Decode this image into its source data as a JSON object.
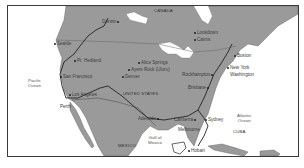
{
  "map": {
    "colors": {
      "land": "#9a9a9a",
      "water": "#ffffff",
      "border": "#3a3a3a",
      "route": "#2a2a2a",
      "lakes": "#ffffff"
    },
    "countries": [
      {
        "name": "CANADA",
        "x": 146,
        "y": 3
      },
      {
        "name": "UNITED STATES",
        "x": 115,
        "y": 86
      },
      {
        "name": "MEXICO",
        "x": 110,
        "y": 138
      },
      {
        "name": "CUBA",
        "x": 225,
        "y": 124
      }
    ],
    "water_bodies": [
      {
        "name": "Pacific\nOcean",
        "x": 26,
        "y": 70
      },
      {
        "name": "Gulf of\nMexico",
        "x": 140,
        "y": 129
      },
      {
        "name": "Atlantic\nOcean",
        "x": 227,
        "y": 107
      }
    ],
    "cities": [
      {
        "name": "Darwin",
        "x": 95,
        "y": 14,
        "dot": "right"
      },
      {
        "name": "Seattle",
        "x": 48,
        "y": 38,
        "dot": "left"
      },
      {
        "name": "Pt. Hedland",
        "x": 67,
        "y": 53,
        "dot": "left"
      },
      {
        "name": "San Francisco",
        "x": 54,
        "y": 70,
        "dot": "left"
      },
      {
        "name": "Los Angeles",
        "x": 63,
        "y": 87,
        "dot": "left"
      },
      {
        "name": "Perth",
        "x": 52,
        "y": 99,
        "dot": "none"
      },
      {
        "name": "Alice Springs",
        "x": 131,
        "y": 57,
        "dot": "left"
      },
      {
        "name": "Ayers Rock (Uluru)",
        "x": 122,
        "y": 65,
        "dot": "left"
      },
      {
        "name": "Denver",
        "x": 118,
        "y": 71,
        "dot": "left"
      },
      {
        "name": "Lookdown",
        "x": 190,
        "y": 26,
        "dot": "left"
      },
      {
        "name": "Cairns",
        "x": 188,
        "y": 34,
        "dot": "left"
      },
      {
        "name": "Boston",
        "x": 228,
        "y": 49,
        "dot": "left"
      },
      {
        "name": "New York",
        "x": 222,
        "y": 61,
        "dot": "left"
      },
      {
        "name": "Washington",
        "x": 222,
        "y": 68,
        "dot": "none"
      },
      {
        "name": "Rockhampton",
        "x": 178,
        "y": 68,
        "dot": "right"
      },
      {
        "name": "Brisbane",
        "x": 183,
        "y": 81,
        "dot": "right"
      },
      {
        "name": "Adelaide",
        "x": 138,
        "y": 112,
        "dot": "right"
      },
      {
        "name": "Canberra",
        "x": 168,
        "y": 113,
        "dot": "right"
      },
      {
        "name": "Sydney",
        "x": 200,
        "y": 113,
        "dot": "left"
      },
      {
        "name": "Melbourne",
        "x": 172,
        "y": 122,
        "dot": "none"
      },
      {
        "name": "Hobart",
        "x": 185,
        "y": 144,
        "dot": "left"
      }
    ]
  }
}
